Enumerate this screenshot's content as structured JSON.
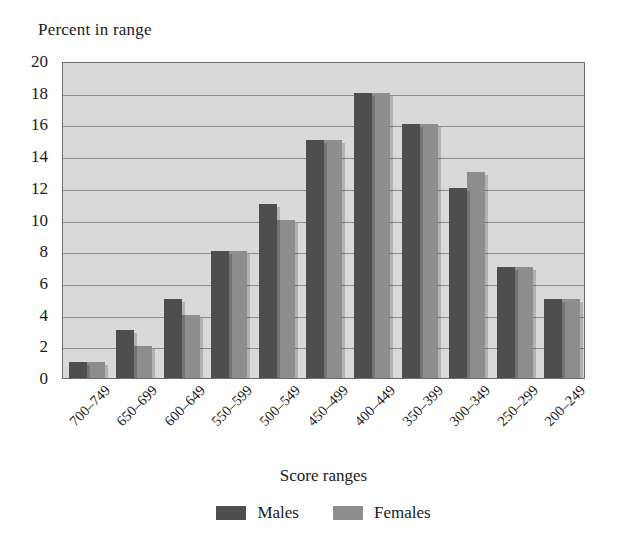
{
  "chart_data": {
    "type": "bar",
    "title": "",
    "subtitle": "",
    "xlabel": "Score ranges",
    "ylabel": "Percent in range",
    "categories": [
      "700–749",
      "650–699",
      "600–649",
      "550–599",
      "500–549",
      "450–499",
      "400–449",
      "350–399",
      "300–349",
      "250–299",
      "200–249"
    ],
    "series": [
      {
        "name": "Males",
        "color": "#4e4e4e",
        "values": [
          1,
          3,
          5,
          8,
          11,
          15,
          18,
          16,
          12,
          7,
          5
        ]
      },
      {
        "name": "Females",
        "color": "#8d8d8d",
        "values": [
          1,
          2,
          4,
          8,
          10,
          15,
          18,
          16,
          13,
          7,
          5
        ]
      }
    ],
    "ylim": [
      0,
      20
    ],
    "ytick_step": 2,
    "yticks": [
      20,
      18,
      16,
      14,
      12,
      10,
      8,
      6,
      4,
      2,
      0
    ],
    "grid": true,
    "grid_axis": "y",
    "legend_position": "bottom",
    "xtick_rotation": -45,
    "plot_background": "#d9d9d9",
    "gridline_color": "#8c8c8c",
    "axis_color": "#6e6e6e",
    "figure_background": "#ffffff"
  }
}
